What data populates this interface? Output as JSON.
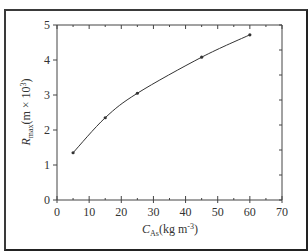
{
  "chart_data": {
    "type": "line",
    "title": "",
    "xlabel": "C_As (kg m^-3)",
    "ylabel": "R_max (m × 10^3)",
    "xlabel_parts": {
      "main": "C",
      "sub": "As",
      "units": "(kg m",
      "sup": "-3",
      "close": ")"
    },
    "ylabel_parts": {
      "main": "R",
      "sub": "max",
      "units": "(m × 10",
      "sup": "3",
      "close": ")"
    },
    "xlim": [
      0,
      70
    ],
    "ylim": [
      0,
      5
    ],
    "x_ticks": [
      0,
      10,
      20,
      30,
      40,
      50,
      60,
      70
    ],
    "y_ticks": [
      0,
      1,
      2,
      3,
      4,
      5
    ],
    "x_tick_labels": [
      "0",
      "10",
      "20",
      "30",
      "40",
      "50",
      "60",
      "70"
    ],
    "y_tick_labels": [
      "0",
      "1",
      "2",
      "3",
      "4",
      "5"
    ],
    "grid": false,
    "legend": null,
    "series": [
      {
        "name": "R_max",
        "x": [
          5,
          15,
          25,
          45,
          60
        ],
        "y": [
          1.35,
          2.35,
          3.05,
          4.08,
          4.72
        ],
        "marker": "dot",
        "color": "#333333"
      }
    ]
  }
}
